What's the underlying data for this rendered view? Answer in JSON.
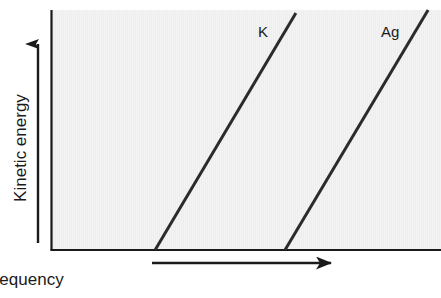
{
  "chart_data": {
    "type": "line",
    "title": "",
    "subtitle": "",
    "xlabel": "Frequency",
    "ylabel": "Kinetic energy",
    "xlim": [
      0,
      1
    ],
    "ylim": [
      0,
      1
    ],
    "grid": false,
    "axis_ticks": false,
    "tick_labels": {
      "x": [],
      "y": []
    },
    "legend_position": "inline-at-line-top",
    "annotations": [
      {
        "text": "K",
        "x": 0.53,
        "y": 0.93
      },
      {
        "text": "Ag",
        "x": 0.85,
        "y": 0.93
      }
    ],
    "series": [
      {
        "name": "K",
        "label": "K",
        "color": "#2b2b2b",
        "threshold_frequency": 0.267,
        "points": [
          {
            "x": 0.267,
            "y": 0.0
          },
          {
            "x": 0.628,
            "y": 0.988
          }
        ]
      },
      {
        "name": "Ag",
        "label": "Ag",
        "color": "#2b2b2b",
        "threshold_frequency": 0.6,
        "points": [
          {
            "x": 0.6,
            "y": 0.0
          },
          {
            "x": 0.967,
            "y": 1.0
          }
        ]
      }
    ]
  },
  "figure": {
    "background_color": "#ffffff",
    "panel_color": "#eeeeee",
    "axis_color": "#1a1a1a",
    "line_color": "#2b2b2b",
    "text_color": "#1a1a1a"
  }
}
